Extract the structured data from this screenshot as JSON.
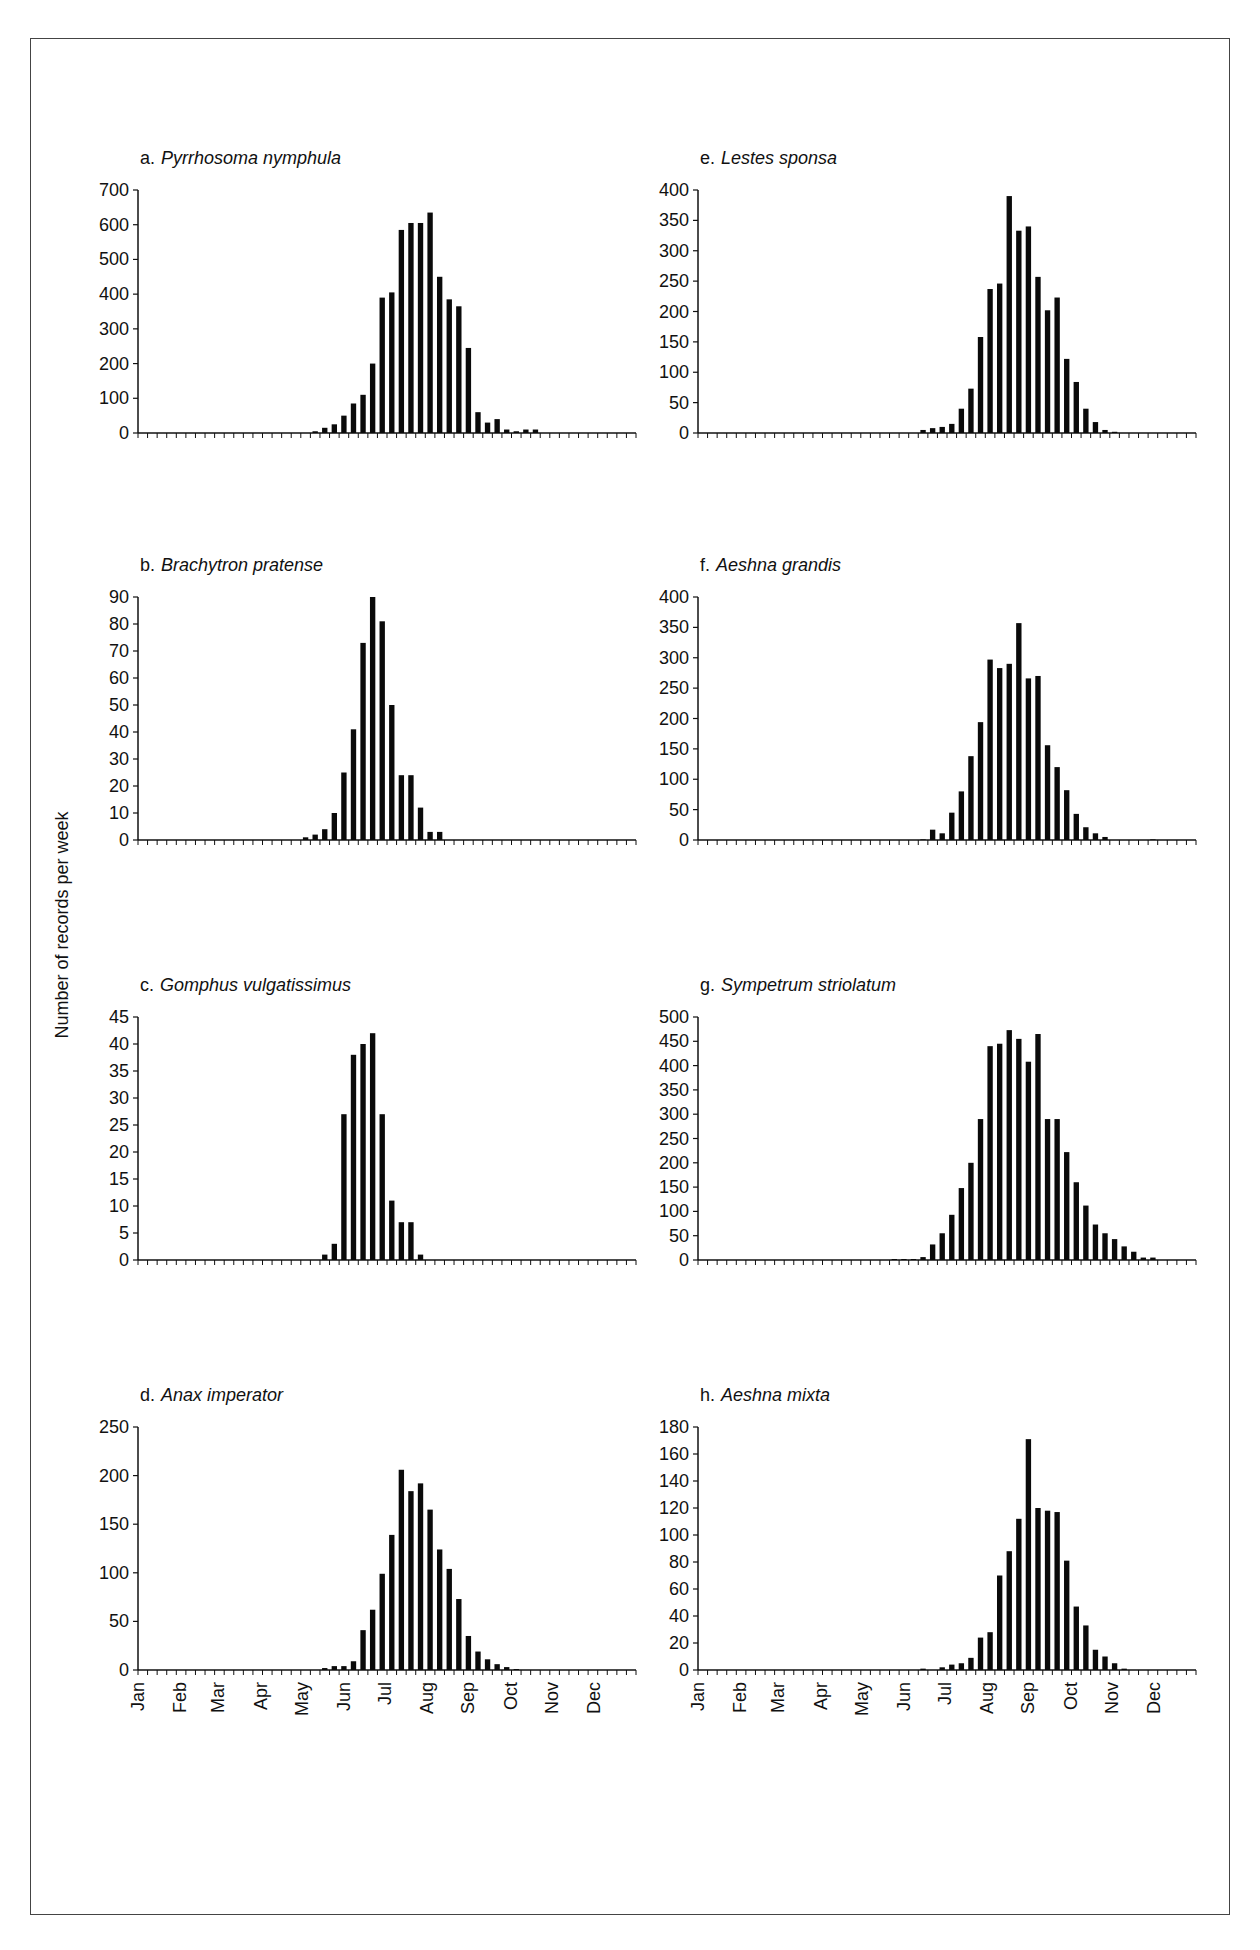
{
  "figure": {
    "ylabel": "Number of records per week",
    "months": [
      "Jan",
      "Feb",
      "Mar",
      "Apr",
      "May",
      "Jun",
      "Jul",
      "Aug",
      "Sep",
      "Oct",
      "Nov",
      "Dec"
    ]
  },
  "chart_data": [
    {
      "id": "a",
      "type": "bar",
      "title": "a.",
      "species": "Pyrrhosoma nymphula",
      "ylim": [
        0,
        700
      ],
      "yticks": [
        0,
        100,
        200,
        300,
        400,
        500,
        600,
        700
      ],
      "xlabel": "",
      "ylabel": "Number of records per week",
      "start_week": 18,
      "values": [
        5,
        15,
        25,
        50,
        85,
        110,
        200,
        390,
        405,
        585,
        605,
        605,
        635,
        450,
        385,
        365,
        245,
        60,
        30,
        40,
        10,
        5,
        10,
        10
      ]
    },
    {
      "id": "e",
      "type": "bar",
      "title": "e.",
      "species": "Lestes sponsa",
      "ylim": [
        0,
        400
      ],
      "yticks": [
        0,
        50,
        100,
        150,
        200,
        250,
        300,
        350,
        400
      ],
      "start_week": 23,
      "values": [
        5,
        8,
        10,
        15,
        40,
        73,
        158,
        237,
        246,
        390,
        333,
        340,
        257,
        202,
        223,
        122,
        84,
        40,
        18,
        5,
        2
      ]
    },
    {
      "id": "b",
      "type": "bar",
      "title": "b.",
      "species": "Brachytron pratense",
      "ylim": [
        0,
        90
      ],
      "yticks": [
        0,
        10,
        20,
        30,
        40,
        50,
        60,
        70,
        80,
        90
      ],
      "start_week": 17,
      "values": [
        1,
        2,
        4,
        10,
        25,
        41,
        73,
        90,
        81,
        50,
        24,
        24,
        12,
        3,
        3
      ]
    },
    {
      "id": "f",
      "type": "bar",
      "title": "f.",
      "species": "Aeshna grandis",
      "ylim": [
        0,
        400
      ],
      "yticks": [
        0,
        50,
        100,
        150,
        200,
        250,
        300,
        350,
        400
      ],
      "start_week": 23,
      "values": [
        1,
        17,
        11,
        45,
        80,
        138,
        194,
        297,
        283,
        290,
        357,
        266,
        270,
        156,
        120,
        82,
        43,
        21,
        11,
        5,
        0,
        0,
        0,
        0,
        1
      ]
    },
    {
      "id": "c",
      "type": "bar",
      "title": "c.",
      "species": "Gomphus vulgatissimus",
      "ylim": [
        0,
        45
      ],
      "yticks": [
        0,
        5,
        10,
        15,
        20,
        25,
        30,
        35,
        40,
        45
      ],
      "start_week": 19,
      "values": [
        1,
        3,
        27,
        38,
        40,
        42,
        27,
        11,
        7,
        7,
        1
      ]
    },
    {
      "id": "g",
      "type": "bar",
      "title": "g.",
      "species": "Sympetrum striolatum",
      "ylim": [
        0,
        500
      ],
      "yticks": [
        0,
        50,
        100,
        150,
        200,
        250,
        300,
        350,
        400,
        450,
        500
      ],
      "start_week": 20,
      "values": [
        2,
        2,
        2,
        6,
        32,
        55,
        93,
        148,
        200,
        290,
        440,
        445,
        473,
        455,
        408,
        465,
        290,
        290,
        222,
        160,
        112,
        73,
        55,
        43,
        28,
        17,
        5,
        5
      ]
    },
    {
      "id": "d",
      "type": "bar",
      "title": "d.",
      "species": "Anax imperator",
      "ylim": [
        0,
        250
      ],
      "yticks": [
        0,
        50,
        100,
        150,
        200,
        250
      ],
      "start_week": 19,
      "values": [
        2,
        4,
        4,
        9,
        41,
        62,
        99,
        139,
        206,
        184,
        192,
        165,
        124,
        104,
        73,
        35,
        19,
        11,
        6,
        3,
        1
      ]
    },
    {
      "id": "h",
      "type": "bar",
      "title": "h.",
      "species": "Aeshna mixta",
      "ylim": [
        0,
        180
      ],
      "yticks": [
        0,
        20,
        40,
        60,
        80,
        100,
        120,
        140,
        160,
        180
      ],
      "start_week": 23,
      "values": [
        1,
        0,
        2,
        4,
        5,
        9,
        24,
        28,
        70,
        88,
        112,
        171,
        120,
        118,
        117,
        81,
        47,
        33,
        15,
        10,
        5,
        1
      ]
    }
  ]
}
